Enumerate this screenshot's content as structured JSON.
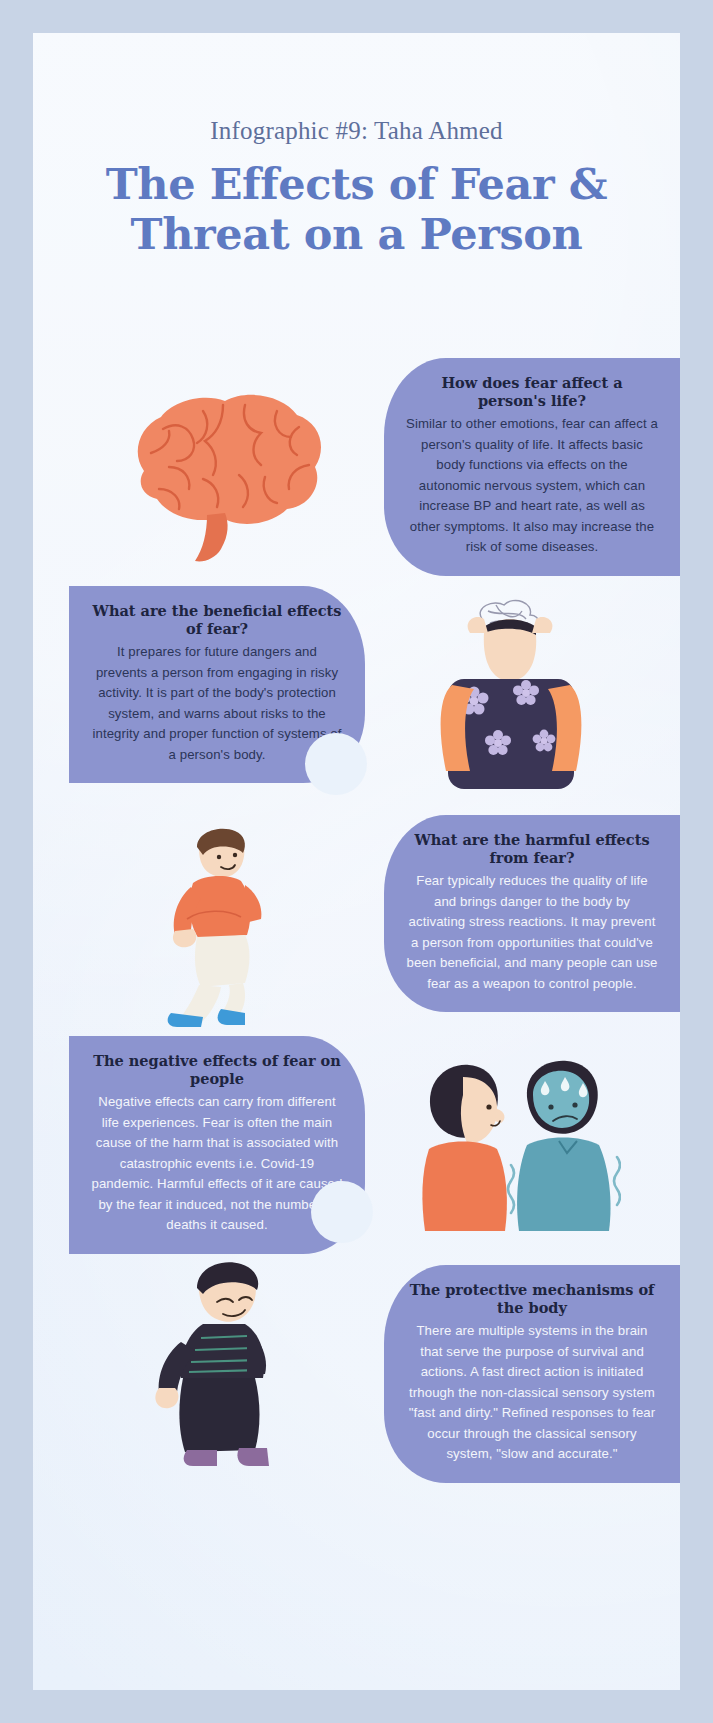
{
  "header": {
    "byline": "Infographic #9: Taha Ahmed",
    "title_line1": "The Effects of Fear &",
    "title_line2": "Threat on a Person"
  },
  "colors": {
    "page_background": "#eaf2fb",
    "scan_border": "#c8d4e6",
    "blob": "#8c94cf",
    "title_blue": "#5f7ac2",
    "byline_grey": "#5e6f9b",
    "body_dark": "#2b3558",
    "body_light": "#f3f5fb",
    "brain_orange": "#f08763",
    "skin": "#f6d9c0",
    "shirt_orange": "#ee7a52",
    "shirt_teal": "#6fb0bf",
    "hair_dark": "#2b2533",
    "shoe_blue": "#3e9ad8"
  },
  "blocks": [
    {
      "id": "how-fear-affects-life",
      "side": "right",
      "title": "How does fear affect a person's life?",
      "body": "Similar to other emotions, fear can affect a person's quality of life. It affects basic body functions via effects on the autonomic nervous system, which can increase BP and heart rate, as well as other symptoms. It also may increase the risk of some diseases.",
      "body_color": "dark"
    },
    {
      "id": "beneficial-effects",
      "side": "left",
      "title": "What are the beneficial effects of fear?",
      "body": "It prepares for future dangers and prevents a person from engaging in risky activity. It is part of the body's protection system, and warns about risks to the integrity and proper function of systems of a person's body.",
      "body_color": "dark"
    },
    {
      "id": "harmful-effects",
      "side": "right",
      "title": "What are the harmful effects from fear?",
      "body": "Fear typically reduces the quality of life and brings danger to the body by activating stress reactions. It may prevent a person from opportunities that could've been beneficial, and many people can use fear as a weapon to control people.",
      "body_color": "light"
    },
    {
      "id": "negative-effects-on-people",
      "side": "left",
      "title": "The negative effects of fear on people",
      "body": "Negative effects can carry from different life experiences. Fear is often the main cause of the harm that is associated with catastrophic events i.e. Covid-19 pandemic. Harmful effects of it are caused by the fear it induced, not the number of deaths it caused.",
      "body_color": "light"
    },
    {
      "id": "protective-mechanisms",
      "side": "right",
      "title": "The protective mechanisms of the body",
      "body": "There are multiple systems in the brain that serve the purpose of survival and actions. A fast direct action is initiated trhough the non-classical sensory system \"fast and dirty.\" Refined responses to fear occur through the classical sensory system, \"slow and accurate.\"",
      "body_color": "light"
    }
  ],
  "illustrations": [
    {
      "id": "brain",
      "name": "brain-illustration",
      "alt": "Orange anatomical brain with brain stem"
    },
    {
      "id": "stress",
      "name": "stressed-woman-illustration",
      "alt": "Woman in floral dress holding her head, hair scribbled"
    },
    {
      "id": "anx",
      "name": "anxious-man-illustration",
      "alt": "Man in orange shirt sitting hunched with hands clasped"
    },
    {
      "id": "pair",
      "name": "two-people-illustration",
      "alt": "Woman in orange top facing a frightened sweating man in teal shirt"
    },
    {
      "id": "sad",
      "name": "crying-man-illustration",
      "alt": "Man in dark clothes crying and wiping his eyes"
    }
  ]
}
